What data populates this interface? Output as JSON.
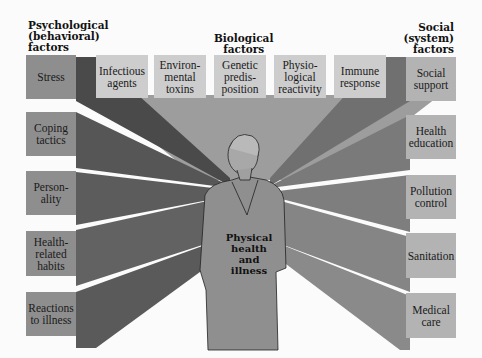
{
  "headers": {
    "psychological": "Psychological\n(behavioral)\nfactors",
    "biological": "Biological\nfactors",
    "social": "Social\n(system)\nfactors"
  },
  "psychological_factors": [
    {
      "label": "Stress"
    },
    {
      "label": "Coping\ntactics"
    },
    {
      "label": "Person-\nality"
    },
    {
      "label": "Health-\nrelated\nhabits"
    },
    {
      "label": "Reactions\nto illness"
    }
  ],
  "biological_factors": [
    {
      "label": "Infectious\nagents"
    },
    {
      "label": "Environ-\nmental\ntoxins"
    },
    {
      "label": "Genetic\npredis-\nposition"
    },
    {
      "label": "Physio-\nlogical\nreactivity"
    },
    {
      "label": "Immune\nresponse"
    }
  ],
  "social_factors": [
    {
      "label": "Social\nsupport"
    },
    {
      "label": "Health\neducation"
    },
    {
      "label": "Pollution\ncontrol"
    },
    {
      "label": "Sanitation"
    },
    {
      "label": "Medical\ncare"
    }
  ],
  "center": {
    "label": "Physical\nhealth\nand\nillness",
    "figure_icon": "person-figure-icon"
  },
  "colors": {
    "left_box": "#8e8e8e",
    "top_box": "#cdcdcd",
    "right_box": "#b3b3b3",
    "left_beam": "#5a5a5a",
    "top_beam": "#9a9a9a",
    "right_beam": "#7d7d7d",
    "background": "#fbfbfb"
  }
}
